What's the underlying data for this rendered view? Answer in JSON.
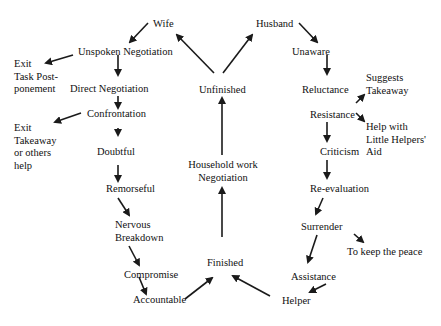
{
  "diagram": {
    "type": "flow",
    "center": {
      "unfinished": "Unfinished",
      "household_line1": "Household work",
      "household_line2": "Negotiation",
      "finished": "Finished"
    },
    "wife_branch": {
      "wife": "Wife",
      "unspoken": "Unspoken Negotiation",
      "exit1_line1": "Exit",
      "exit1_line2": "Task Post-",
      "exit1_line3": "ponement",
      "direct": "Direct Negotiation",
      "confrontation": "Confrontation",
      "exit2_line1": "Exit",
      "exit2_line2": "Takeaway",
      "exit2_line3": "or others",
      "exit2_line4": "help",
      "doubtful": "Doubtful",
      "remorseful": "Remorseful",
      "nervous_line1": "Nervous",
      "nervous_line2": "Breakdown",
      "compromise": "Compromise",
      "accountable": "Accountable"
    },
    "husband_branch": {
      "husband": "Husband",
      "unaware": "Unaware",
      "reluctance": "Reluctance",
      "suggests_line1": "Suggests",
      "suggests_line2": "Takeaway",
      "resistance": "Resistance",
      "help_line1": "Help with",
      "help_line2": "Little Helpers'",
      "help_line3": "Aid",
      "criticism": "Criticism",
      "reevaluation": "Re-evaluation",
      "surrender": "Surrender",
      "keep_peace": "To keep the peace",
      "assistance": "Assistance",
      "helper": "Helper"
    },
    "edges": [
      [
        "Finished",
        "Household work Negotiation"
      ],
      [
        "Household work Negotiation",
        "Unfinished"
      ],
      [
        "Unfinished",
        "Wife"
      ],
      [
        "Unfinished",
        "Husband"
      ],
      [
        "Wife",
        "Unspoken Negotiation"
      ],
      [
        "Unspoken Negotiation",
        "Exit Task Postponement"
      ],
      [
        "Unspoken Negotiation",
        "Direct Negotiation"
      ],
      [
        "Direct Negotiation",
        "Confrontation"
      ],
      [
        "Confrontation",
        "Exit Takeaway or others help"
      ],
      [
        "Confrontation",
        "Doubtful"
      ],
      [
        "Doubtful",
        "Remorseful"
      ],
      [
        "Remorseful",
        "Nervous Breakdown"
      ],
      [
        "Nervous Breakdown",
        "Compromise"
      ],
      [
        "Compromise",
        "Accountable"
      ],
      [
        "Accountable",
        "Finished"
      ],
      [
        "Husband",
        "Unaware"
      ],
      [
        "Unaware",
        "Reluctance"
      ],
      [
        "Reluctance",
        "Suggests Takeaway"
      ],
      [
        "Resistance",
        "Help with Little Helpers' Aid"
      ],
      [
        "Resistance",
        "Criticism"
      ],
      [
        "Criticism",
        "Re-evaluation"
      ],
      [
        "Re-evaluation",
        "Surrender"
      ],
      [
        "Surrender",
        "To keep the peace"
      ],
      [
        "Surrender",
        "Assistance"
      ],
      [
        "Assistance",
        "Helper"
      ],
      [
        "Helper",
        "Finished"
      ]
    ]
  }
}
